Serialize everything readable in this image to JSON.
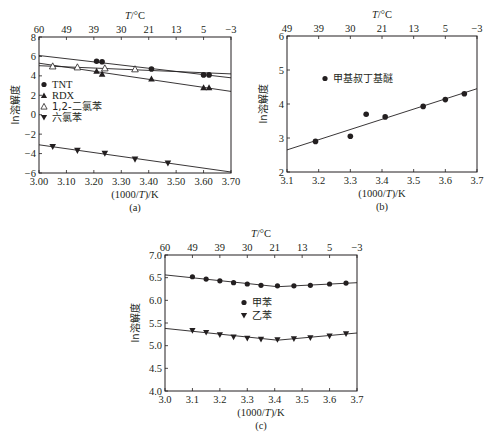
{
  "chart_data": [
    {
      "panel": "a",
      "type": "scatter",
      "caption": "(a)",
      "xlabel": "(1000/T)/K",
      "ylabel": "ln溶解度",
      "top_axis_label": "T/°C",
      "xlim": [
        3.0,
        3.7
      ],
      "ylim": [
        -6,
        8
      ],
      "x_ticks": [
        "3.00",
        "3.10",
        "3.20",
        "3.30",
        "3.40",
        "3.50",
        "3.60",
        "3.70"
      ],
      "y_ticks": [
        "-6",
        "-4",
        "-2",
        "0",
        "2",
        "4",
        "6",
        "8"
      ],
      "top_ticks": [
        "60",
        "49",
        "39",
        "30",
        "21",
        "13",
        "5",
        "-3"
      ],
      "grid": false,
      "legend_position": "center-left",
      "series": [
        {
          "name": "TNT",
          "marker": "circle",
          "x": [
            3.21,
            3.23,
            3.41,
            3.6,
            3.62
          ],
          "y": [
            5.5,
            5.45,
            4.7,
            4.1,
            4.1
          ],
          "fit": [
            [
              3.0,
              6.1
            ],
            [
              3.7,
              3.8
            ]
          ]
        },
        {
          "name": "RDX",
          "marker": "triangle-up",
          "x": [
            3.21,
            3.23,
            3.41,
            3.6,
            3.62
          ],
          "y": [
            4.5,
            4.2,
            3.7,
            2.8,
            2.8
          ],
          "fit": [
            [
              3.0,
              5.3
            ],
            [
              3.7,
              2.4
            ]
          ]
        },
        {
          "name": "1,2-二氯苯",
          "marker": "triangle-up-open",
          "x": [
            3.05,
            3.14,
            3.24,
            3.35
          ],
          "y": [
            5.0,
            4.9,
            4.8,
            4.7
          ],
          "fit": [
            [
              3.0,
              5.05
            ],
            [
              3.7,
              4.2
            ]
          ]
        },
        {
          "name": "六氯苯",
          "marker": "triangle-down",
          "x": [
            3.05,
            3.14,
            3.24,
            3.35,
            3.47
          ],
          "y": [
            -3.3,
            -3.7,
            -4.0,
            -4.6,
            -5.0
          ],
          "fit": [
            [
              3.0,
              -3.1
            ],
            [
              3.7,
              -5.9
            ]
          ]
        }
      ]
    },
    {
      "panel": "b",
      "type": "scatter",
      "caption": "(b)",
      "xlabel": "(1000/T)/K",
      "ylabel": "ln溶解度",
      "top_axis_label": "T/°C",
      "xlim": [
        3.1,
        3.7
      ],
      "ylim": [
        2,
        6
      ],
      "x_ticks": [
        "3.1",
        "3.2",
        "3.3",
        "3.4",
        "3.5",
        "3.6",
        "3.7"
      ],
      "y_ticks": [
        "2",
        "3",
        "4",
        "5",
        "6"
      ],
      "top_ticks": [
        "49",
        "39",
        "30",
        "21",
        "13",
        "5",
        "-3"
      ],
      "grid": false,
      "legend_position": "upper-left",
      "series": [
        {
          "name": "甲基叔丁基醚",
          "marker": "circle",
          "x": [
            3.19,
            3.3,
            3.35,
            3.41,
            3.53,
            3.6,
            3.66
          ],
          "y": [
            2.9,
            3.05,
            3.7,
            3.62,
            3.93,
            4.13,
            4.3
          ],
          "fit": [
            [
              3.1,
              2.65
            ],
            [
              3.7,
              4.45
            ]
          ]
        }
      ]
    },
    {
      "panel": "c",
      "type": "scatter",
      "caption": "(c)",
      "xlabel": "(1000/T)/K",
      "ylabel": "ln溶解度",
      "top_axis_label": "T/°C",
      "xlim": [
        3.0,
        3.7
      ],
      "ylim": [
        4.0,
        7.0
      ],
      "x_ticks": [
        "3.0",
        "3.1",
        "3.2",
        "3.3",
        "3.4",
        "3.5",
        "3.6",
        "3.7"
      ],
      "y_ticks": [
        "4.0",
        "4.5",
        "5.0",
        "5.5",
        "6.0",
        "6.5",
        "7.0"
      ],
      "top_ticks": [
        "60",
        "49",
        "39",
        "30",
        "21",
        "13",
        "5",
        "-3"
      ],
      "grid": false,
      "legend_position": "center",
      "series": [
        {
          "name": "甲苯",
          "marker": "circle",
          "x": [
            3.1,
            3.15,
            3.2,
            3.25,
            3.3,
            3.35,
            3.41,
            3.47,
            3.53,
            3.6,
            3.66
          ],
          "y": [
            6.52,
            6.47,
            6.43,
            6.39,
            6.36,
            6.33,
            6.32,
            6.32,
            6.33,
            6.36,
            6.38
          ],
          "fit": [
            [
              3.0,
              6.56
            ],
            [
              3.41,
              6.3
            ],
            [
              3.7,
              6.39
            ]
          ]
        },
        {
          "name": "乙苯",
          "marker": "triangle-down",
          "x": [
            3.1,
            3.15,
            3.2,
            3.25,
            3.3,
            3.35,
            3.41,
            3.47,
            3.53,
            3.6,
            3.66
          ],
          "y": [
            5.33,
            5.29,
            5.24,
            5.19,
            5.16,
            5.14,
            5.13,
            5.15,
            5.17,
            5.21,
            5.26
          ],
          "fit": [
            [
              3.0,
              5.38
            ],
            [
              3.41,
              5.12
            ],
            [
              3.7,
              5.28
            ]
          ]
        }
      ]
    }
  ]
}
